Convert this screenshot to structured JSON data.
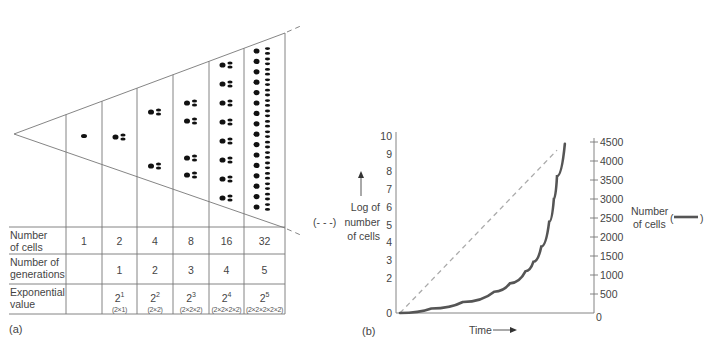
{
  "panel_a": {
    "label": "(a)",
    "table": {
      "row_headers": [
        "Number\nof cells",
        "Number of\ngenerations",
        "Exponential\nvalue"
      ],
      "row_header_lines": [
        [
          "Number",
          "of cells"
        ],
        [
          "Number of",
          "generations"
        ],
        [
          "Exponential",
          "value"
        ]
      ],
      "columns": [
        {
          "cells": "1",
          "generations": "",
          "exp_base": "",
          "exp_power": "",
          "exp_expand": ""
        },
        {
          "cells": "2",
          "generations": "1",
          "exp_base": "2",
          "exp_power": "1",
          "exp_expand": "(2×1)"
        },
        {
          "cells": "4",
          "generations": "2",
          "exp_base": "2",
          "exp_power": "2",
          "exp_expand": "(2×2)"
        },
        {
          "cells": "8",
          "generations": "3",
          "exp_base": "2",
          "exp_power": "3",
          "exp_expand": "(2×2×2)"
        },
        {
          "cells": "16",
          "generations": "4",
          "exp_base": "2",
          "exp_power": "4",
          "exp_expand": "(2×2×2×2)"
        },
        {
          "cells": "32",
          "generations": "5",
          "exp_base": "2",
          "exp_power": "5",
          "exp_expand": "(2×2×2×2×2)"
        }
      ]
    },
    "cell_counts": [
      1,
      2,
      4,
      8,
      16,
      32
    ]
  },
  "panel_b": {
    "label": "(b)",
    "xlabel": "Time",
    "left_axis_label_lines": [
      "Log of",
      "number",
      "of cells"
    ],
    "left_axis_legend": "(- - -)",
    "right_axis_label_lines": [
      "Number",
      "of cells"
    ],
    "right_axis_legend_open": "(",
    "right_axis_legend_close": ")",
    "colors": {
      "log_line": "#aaaaaa",
      "count_curve": "#555555",
      "axis": "#777777"
    }
  },
  "chart_data": {
    "type": "line",
    "title": "",
    "xlabel": "Time",
    "ylabel_left": "Log of number of cells",
    "ylabel_right": "Number of cells",
    "ylim_left": [
      0,
      10
    ],
    "ylim_right": [
      0,
      4500
    ],
    "left_ticks": [
      "0",
      "2",
      "3",
      "4",
      "5",
      "6",
      "7",
      "8",
      "9",
      "10"
    ],
    "left_tick_values": [
      0,
      2,
      3,
      4,
      5,
      6,
      7,
      8,
      9,
      10
    ],
    "right_ticks": [
      "0",
      "500",
      "1000",
      "1500",
      "2000",
      "2500",
      "3000",
      "3500",
      "4000",
      "4500"
    ],
    "right_tick_values": [
      0,
      500,
      1000,
      1500,
      2000,
      2500,
      3000,
      3500,
      4000,
      4500
    ],
    "grid": false,
    "series": [
      {
        "name": "Log of number of cells",
        "style": "dashed",
        "axis": "left",
        "x": [
          0,
          1
        ],
        "y": [
          0,
          9.2
        ]
      },
      {
        "name": "Number of cells",
        "style": "solid",
        "axis": "right",
        "x": [
          0,
          0.2,
          0.4,
          0.6,
          0.7,
          0.8,
          0.85,
          0.9,
          0.95,
          0.98,
          1.0,
          1.05
        ],
        "y": [
          0,
          120,
          290,
          560,
          780,
          1100,
          1350,
          1750,
          2400,
          3000,
          3600,
          4450
        ]
      }
    ]
  }
}
